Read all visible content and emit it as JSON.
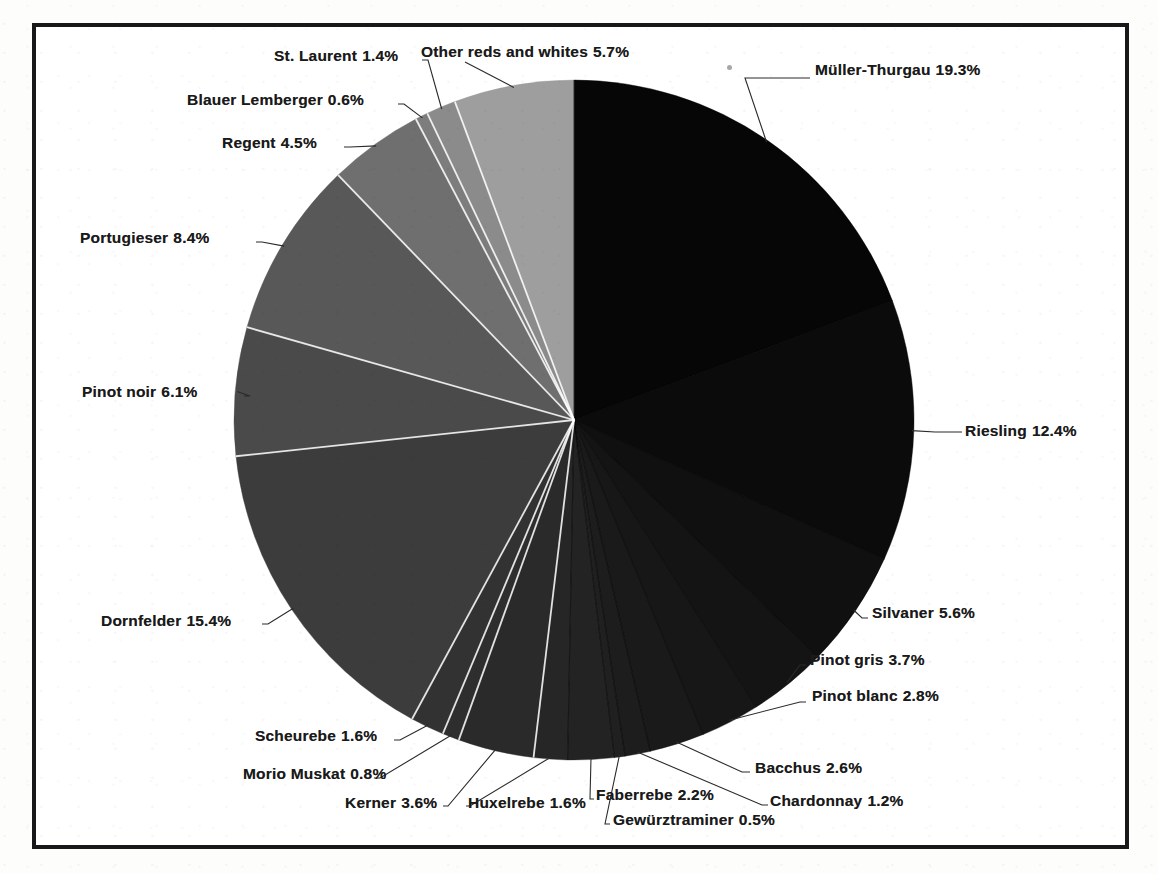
{
  "chart_data": {
    "type": "pie",
    "title": "",
    "subtitle": "",
    "legend_position": "callout-labels",
    "grid": false,
    "value_unit": "%",
    "center": {
      "x": 574,
      "y": 420
    },
    "radius": 340,
    "start_angle_deg": 0,
    "direction": "clockwise",
    "categories": [
      "Müller-Thurgau",
      "Riesling",
      "Silvaner",
      "Pinot gris",
      "Pinot blanc",
      "Bacchus",
      "Chardonnay",
      "Gewürztraminer",
      "Faberrebe",
      "Huxelrebe",
      "Kerner",
      "Morio Muskat",
      "Scheurebe",
      "Dornfelder",
      "Pinot noir",
      "Portugieser",
      "Regent",
      "Blauer Lemberger",
      "St. Laurent",
      "Other reds and whites"
    ],
    "values": [
      19.3,
      12.4,
      5.6,
      3.7,
      2.8,
      2.6,
      1.2,
      0.5,
      2.2,
      1.6,
      3.6,
      0.8,
      1.6,
      15.4,
      6.1,
      8.4,
      4.5,
      0.6,
      1.4,
      5.7
    ],
    "slice_colors": [
      "#060606",
      "#0b0b0b",
      "#101010",
      "#141414",
      "#171717",
      "#1a1a1a",
      "#1d1d1d",
      "#202020",
      "#232323",
      "#262626",
      "#2a2a2a",
      "#2e2e2e",
      "#323232",
      "#3c3c3c",
      "#4a4a4a",
      "#585858",
      "#6f6f6f",
      "#7d7d7d",
      "#8b8b8b",
      "#9e9e9e"
    ]
  },
  "labels": [
    {
      "name": "Müller-Thurgau",
      "value": "19.3%"
    },
    {
      "name": "Riesling",
      "value": "12.4%"
    },
    {
      "name": "Silvaner",
      "value": "5.6%"
    },
    {
      "name": "Pinot gris",
      "value": "3.7%"
    },
    {
      "name": "Pinot blanc",
      "value": "2.8%"
    },
    {
      "name": "Bacchus",
      "value": "2.6%"
    },
    {
      "name": "Chardonnay",
      "value": "1.2%"
    },
    {
      "name": "Gewürztraminer",
      "value": "0.5%"
    },
    {
      "name": "Faberrebe",
      "value": "2.2%"
    },
    {
      "name": "Huxelrebe",
      "value": "1.6%"
    },
    {
      "name": "Kerner",
      "value": "3.6%"
    },
    {
      "name": "Morio Muskat",
      "value": "0.8%"
    },
    {
      "name": "Scheurebe",
      "value": "1.6%"
    },
    {
      "name": "Dornfelder",
      "value": "15.4%"
    },
    {
      "name": "Pinot noir",
      "value": "6.1%"
    },
    {
      "name": "Portugieser",
      "value": "8.4%"
    },
    {
      "name": "Regent",
      "value": "4.5%"
    },
    {
      "name": "Blauer Lemberger",
      "value": "0.6%"
    },
    {
      "name": "St. Laurent",
      "value": "1.4%"
    },
    {
      "name": "Other reds and whites",
      "value": "5.7%"
    }
  ],
  "style": {
    "frame_color": "#18181a",
    "background": "#ffffff",
    "label_color": "#1a1a1a",
    "leader_color": "#2a2a2a"
  }
}
